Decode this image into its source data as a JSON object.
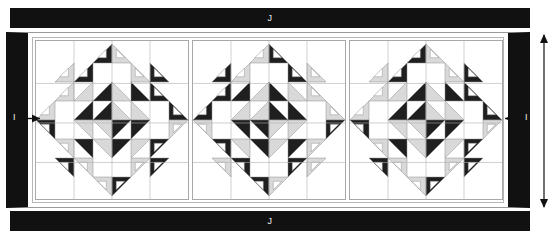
{
  "figure": {
    "type": "quilt-layout-diagram",
    "width": 560,
    "height": 243,
    "background": "#ffffff"
  },
  "bands": {
    "top": {
      "label": "J",
      "color": "#111111",
      "x": 10,
      "y": 8,
      "width": 520,
      "height": 20
    },
    "bottom": {
      "label": "J",
      "color": "#111111",
      "x": 10,
      "y": 211,
      "width": 520,
      "height": 20
    }
  },
  "panel": {
    "x": 6,
    "y": 32,
    "width": 524,
    "height": 176,
    "border_color": "#111111",
    "border_width": 22,
    "inner_background": "#ffffff"
  },
  "dimensions": {
    "left_marker": {
      "label": "I",
      "x": 14,
      "y": 118,
      "direction": "horizontal"
    },
    "right_marker": {
      "label": "I",
      "x": 518,
      "y": 118,
      "direction": "horizontal"
    },
    "vertical_marker": {
      "label": "",
      "x": 544,
      "y": 120,
      "direction": "vertical",
      "arrow_top_y": 33,
      "arrow_bottom_y": 209
    }
  },
  "colors": {
    "black": "#111111",
    "dark": "#1f1f1f",
    "light_gray": "#d9d9d9",
    "mid_gray": "#a6a6a6",
    "white": "#ffffff",
    "gridline": "#b0b0b0",
    "outline": "#8c8c8c"
  },
  "blocks": [
    {
      "name": "star-block-1",
      "pattern": "feathered-star",
      "grid": 8,
      "center_star_points": [
        "dark",
        "light",
        "dark",
        "light",
        "dark",
        "light",
        "dark",
        "light"
      ],
      "corner_feathers": [
        "dark",
        "light",
        "light",
        "dark"
      ]
    },
    {
      "name": "star-block-2",
      "pattern": "feathered-star",
      "grid": 8,
      "center_star_points": [
        "light",
        "dark",
        "light",
        "dark",
        "light",
        "dark",
        "light",
        "dark"
      ],
      "corner_feathers": [
        "light",
        "dark",
        "dark",
        "light"
      ]
    },
    {
      "name": "star-block-3",
      "pattern": "feathered-star",
      "grid": 8,
      "center_star_points": [
        "dark",
        "light",
        "dark",
        "light",
        "dark",
        "light",
        "dark",
        "light"
      ],
      "corner_feathers": [
        "dark",
        "light",
        "light",
        "dark"
      ]
    }
  ]
}
